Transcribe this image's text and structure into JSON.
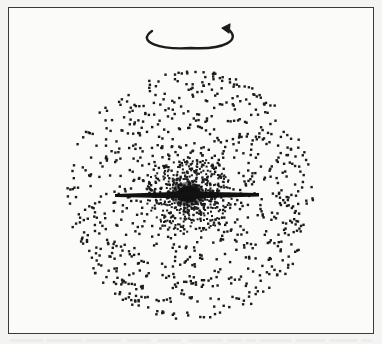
{
  "figure": {
    "rotation_arrow": {
      "direction": "counterclockwise as seen from above",
      "center_x": 191,
      "center_y": 36,
      "rx": 41,
      "ry": 12
    },
    "halo": {
      "center_x": 189,
      "center_y": 194,
      "radius": 125,
      "dot_count": 900,
      "dot_color": "#1c1c1c"
    },
    "bulge": {
      "center_x": 188,
      "center_y": 194,
      "radius": 42,
      "dot_count": 650
    },
    "disk": {
      "x1": 115,
      "x2": 259,
      "y": 195,
      "thickness": 4,
      "color": "#111111"
    },
    "colors": {
      "paper": "#fbfbfa",
      "ink": "#1c1c1c",
      "frame": "#3a3a3a",
      "bleed_through": "#e6e6e3"
    }
  }
}
